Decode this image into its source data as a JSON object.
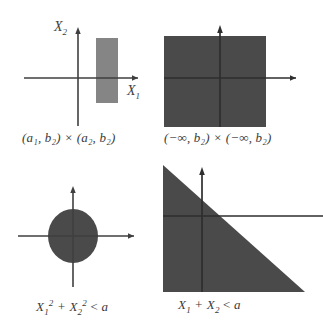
{
  "figure": {
    "type": "diagram",
    "background_color": "#ffffff",
    "axis_color": "#3f3f3f",
    "panels": [
      {
        "id": "top-left",
        "region_shape": "rectangle",
        "region_fill": "#858585",
        "caption": "(a₁, b₂) × (a₂, b₂)",
        "caption_parts": {
          "left_interval": "(a₁, b₂)",
          "operator": "×",
          "right_interval": "(a₂, b₂)"
        },
        "x_axis_label": "X₁",
        "y_axis_label": "X₂"
      },
      {
        "id": "top-right",
        "region_shape": "filled-square",
        "region_fill": "#4a4a4a",
        "caption": "(−∞, b₂) × (−∞, b₂)",
        "caption_parts": {
          "left_interval": "(−∞, b₂)",
          "operator": "×",
          "right_interval": "(−∞, b₂)"
        },
        "x_axis_label": "X₁",
        "y_axis_label": "X₂"
      },
      {
        "id": "bottom-left",
        "region_shape": "ellipse",
        "region_fill": "#4a4a4a",
        "caption": "X₁² + X₂² < a",
        "caption_parts": {
          "inequality": "X₁² + X₂² < a"
        },
        "x_axis_label": "X₁",
        "y_axis_label": "X₂"
      },
      {
        "id": "bottom-right",
        "region_shape": "triangle-halfplane",
        "region_fill": "#4a4a4a",
        "caption": "X₁ + X₂ < a",
        "caption_parts": {
          "inequality": "X₁ + X₂ < a"
        },
        "x_axis_label": "X₁",
        "y_axis_label": "X₂"
      }
    ]
  },
  "labels": {
    "x1": "X",
    "x2": "X",
    "sub1": "1",
    "sub2": "2",
    "times": "×",
    "lt": "<",
    "plus": "+",
    "a": "a",
    "sup2": "2",
    "inf_neg": "−∞",
    "paren_open": "(",
    "paren_close": ")",
    "comma": ","
  },
  "captions": {
    "tl": "(a₁, b₂) × (a₂, b₂)",
    "tr": "(−∞, b₂) × (−∞, b₂)",
    "bl": "X₁² + X₂² < a",
    "br": "X₁ + X₂ < a"
  },
  "axis_labels": {
    "x1": "X₁",
    "x2": "X₂"
  }
}
